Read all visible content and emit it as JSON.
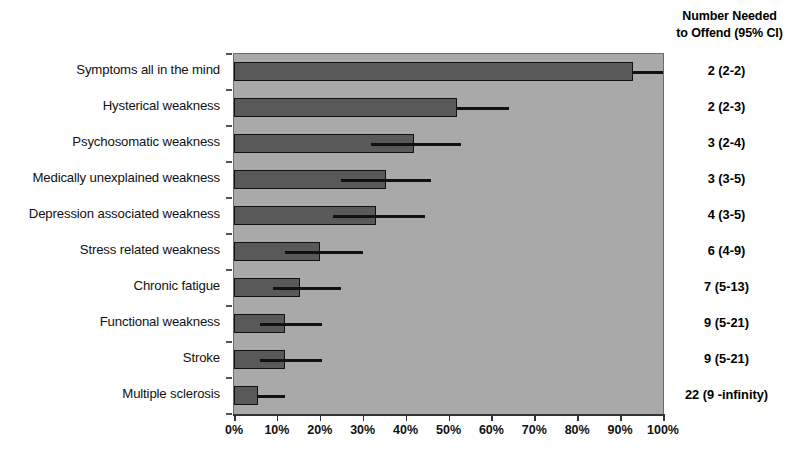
{
  "header": {
    "line1": "Number Needed",
    "line2": "to Offend (95% CI)"
  },
  "axis": {
    "xticklabels": [
      "0%",
      "10%",
      "20%",
      "30%",
      "40%",
      "50%",
      "60%",
      "70%",
      "80%",
      "90%",
      "100%"
    ]
  },
  "rows": [
    {
      "label": "Symptoms all in the mind",
      "value": 93,
      "ci_low": 93,
      "ci_high": 100,
      "nno": "2 (2-2)"
    },
    {
      "label": "Hysterical weakness",
      "value": 52,
      "ci_low": 52,
      "ci_high": 64,
      "nno": "2 (2-3)"
    },
    {
      "label": "Psychosomatic weakness",
      "value": 42,
      "ci_low": 32,
      "ci_high": 53,
      "nno": "3 (2-4)"
    },
    {
      "label": "Medically unexplained weakness",
      "value": 35.5,
      "ci_low": 25,
      "ci_high": 46,
      "nno": "3 (3-5)"
    },
    {
      "label": "Depression associated weakness",
      "value": 33,
      "ci_low": 23,
      "ci_high": 44.5,
      "nno": "4 (3-5)"
    },
    {
      "label": "Stress related weakness",
      "value": 20,
      "ci_low": 12,
      "ci_high": 30,
      "nno": "6 (4-9)"
    },
    {
      "label": "Chronic fatigue",
      "value": 15.5,
      "ci_low": 9,
      "ci_high": 25,
      "nno": "7 (5-13)"
    },
    {
      "label": "Functional  weakness",
      "value": 12,
      "ci_low": 6,
      "ci_high": 20.5,
      "nno": "9 (5-21)"
    },
    {
      "label": "Stroke",
      "value": 12,
      "ci_low": 6,
      "ci_high": 20.5,
      "nno": "9 (5-21)"
    },
    {
      "label": "Multiple  sclerosis",
      "value": 5.5,
      "ci_low": 5.5,
      "ci_high": 12,
      "nno": "22 (9 -infinity)"
    }
  ],
  "colors": {
    "plot_background": "#a9a9a9",
    "bar_fill": "#595959",
    "bar_border": "#111111",
    "error_bar": "#111111",
    "page_background": "#ffffff"
  },
  "chart_data": {
    "type": "bar",
    "orientation": "horizontal",
    "title": "",
    "subtitle": "",
    "xlabel": "",
    "ylabel": "",
    "xlim": [
      0,
      100
    ],
    "xticks": [
      0,
      10,
      20,
      30,
      40,
      50,
      60,
      70,
      80,
      90,
      100
    ],
    "xticklabels": [
      "0%",
      "10%",
      "20%",
      "30%",
      "40%",
      "50%",
      "60%",
      "70%",
      "80%",
      "90%",
      "100%"
    ],
    "grid": false,
    "legend": "none",
    "categories": [
      "Symptoms all in the mind",
      "Hysterical weakness",
      "Psychosomatic weakness",
      "Medically unexplained weakness",
      "Depression associated weakness",
      "Stress related weakness",
      "Chronic fatigue",
      "Functional  weakness",
      "Stroke",
      "Multiple  sclerosis"
    ],
    "values": [
      93,
      52,
      42,
      35.5,
      33,
      20,
      15.5,
      12,
      12,
      5.5
    ],
    "error_low": [
      93,
      52,
      32,
      25,
      23,
      12,
      9,
      6,
      6,
      5.5
    ],
    "error_high": [
      100,
      64,
      53,
      46,
      44.5,
      30,
      25,
      20.5,
      20.5,
      12
    ],
    "annotations": {
      "column_header": "Number Needed to Offend (95% CI)",
      "column_values": [
        "2 (2-2)",
        "2 (2-3)",
        "3 (2-4)",
        "3 (3-5)",
        "4 (3-5)",
        "6 (4-9)",
        "7 (5-13)",
        "9 (5-21)",
        "9 (5-21)",
        "22 (9 -infinity)"
      ]
    }
  }
}
